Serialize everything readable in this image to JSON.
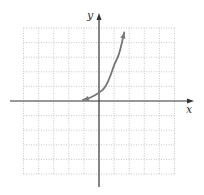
{
  "chart_data": {
    "type": "line",
    "title": "",
    "xlabel": "x",
    "ylabel": "y",
    "grid": true,
    "grid_style": "dotted",
    "xlim": [
      -5,
      5
    ],
    "ylim": [
      -5,
      5
    ],
    "tick_labels": false,
    "series": [
      {
        "name": "curve",
        "color": "#777777",
        "description": "exponential-shaped curve, asymptotic to x-axis on the left, arrows at both ends",
        "x": [
          -1.07,
          -0.6,
          0.0,
          0.4,
          0.8,
          1.0,
          1.33,
          1.67
        ],
        "y": [
          0.07,
          0.2,
          0.55,
          0.9,
          1.8,
          2.5,
          3.15,
          4.7
        ]
      }
    ]
  },
  "colors": {
    "axis": "#333333",
    "grid": "#bbbbbb",
    "curve": "#7a7a7a"
  },
  "labels": {
    "x_axis": "x",
    "y_axis": "y"
  }
}
